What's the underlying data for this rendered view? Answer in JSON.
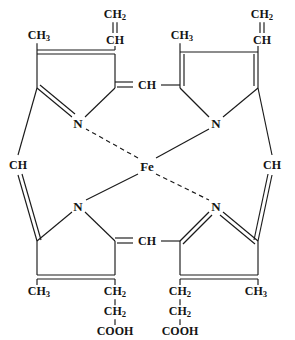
{
  "diagram": {
    "type": "chemical-structure",
    "center_metal": "Fe",
    "line_color": "#1a1a1a",
    "background": "#ffffff"
  },
  "labels": {
    "metal": {
      "text": "Fe",
      "x": 147,
      "y": 166
    },
    "nitrogens": [
      {
        "id": "n-top-left",
        "text": "N",
        "x": 78,
        "y": 123
      },
      {
        "id": "n-top-right",
        "text": "N",
        "x": 216,
        "y": 123
      },
      {
        "id": "n-bottom-left",
        "text": "N",
        "x": 78,
        "y": 206
      },
      {
        "id": "n-bottom-right",
        "text": "N",
        "x": 216,
        "y": 206
      }
    ],
    "meso_bridges": [
      {
        "id": "meso-top",
        "text": "CH",
        "x": 147,
        "y": 85
      },
      {
        "id": "meso-left",
        "text": "CH",
        "x": 18,
        "y": 165
      },
      {
        "id": "meso-right",
        "text": "CH",
        "x": 272,
        "y": 165
      },
      {
        "id": "meso-bottom",
        "text": "CH",
        "x": 147,
        "y": 241
      }
    ],
    "methyls": [
      {
        "id": "methyl-top-left",
        "text": "CH",
        "sub": "3",
        "x": 39,
        "y": 36
      },
      {
        "id": "methyl-top-right",
        "text": "CH",
        "sub": "3",
        "x": 182,
        "y": 36
      },
      {
        "id": "methyl-bottom-left",
        "text": "CH",
        "sub": "3",
        "x": 39,
        "y": 292
      },
      {
        "id": "methyl-bottom-right",
        "text": "CH",
        "sub": "3",
        "x": 256,
        "y": 292
      }
    ],
    "vinyl_groups": [
      {
        "id": "vinyl-left",
        "ch2": {
          "text": "CH",
          "sub": "2",
          "x": 115,
          "y": 15
        },
        "ch": {
          "text": "CH",
          "x": 115,
          "y": 40
        }
      },
      {
        "id": "vinyl-right",
        "ch2": {
          "text": "CH",
          "sub": "2",
          "x": 262,
          "y": 15
        },
        "ch": {
          "text": "CH",
          "x": 262,
          "y": 40
        }
      }
    ],
    "propionic_chains": [
      {
        "id": "propionate-left",
        "ch2_a": {
          "text": "CH",
          "sub": "2",
          "x": 115,
          "y": 292
        },
        "ch2_b": {
          "text": "CH",
          "sub": "2",
          "x": 115,
          "y": 312
        },
        "cooh": {
          "text": "COOH",
          "x": 115,
          "y": 331
        }
      },
      {
        "id": "propionate-right",
        "ch2_a": {
          "text": "CH",
          "sub": "2",
          "x": 180,
          "y": 292
        },
        "ch2_b": {
          "text": "CH",
          "sub": "2",
          "x": 180,
          "y": 312
        },
        "cooh": {
          "text": "COOH",
          "x": 180,
          "y": 331
        }
      }
    ]
  },
  "bonds": {
    "solid_single": [
      "methyl-top-left to ring-tl-left-vertex",
      "vinyl-left-ch to ring-tl-right-vertex",
      "ring-tl-left-vertex to n-top-left",
      "ring-tr-top-edge",
      "n-top-right to Fe",
      "n-bottom-left to Fe",
      "meso-top to ring-tr-left-vertex",
      "meso-bottom to ring-br-left-vertex",
      "meso-left to ring-bl-left-vertex",
      "meso-right to ring-tr-right-vertex"
    ],
    "double": [
      "ring-tl-top-edge",
      "ring-tl-left-vertex to n-top-left",
      "vinyl-left CH2=CH",
      "vinyl-right CH2=CH",
      "meso-top to ring-tl-right-vertex",
      "meso-bottom to ring-bl-right-vertex",
      "ring-bl-bottom-edge",
      "ring-br-bottom-edge",
      "meso-left to ring-tl-left-vertex",
      "meso-right to ring-br-right-vertex"
    ],
    "dashed_coordinate": [
      "n-top-left to Fe",
      "n-bottom-right to Fe"
    ]
  }
}
